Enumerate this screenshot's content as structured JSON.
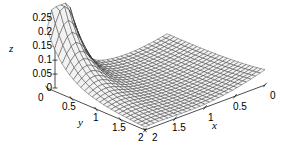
{
  "chart_data": {
    "type": "surface",
    "title": "",
    "xlabel": "x",
    "ylabel": "y",
    "zlabel": "z",
    "xlim": [
      0,
      2
    ],
    "ylim": [
      0,
      2
    ],
    "zlim": [
      0,
      0.28
    ],
    "grid": false,
    "legend": "none",
    "x_ticks": [
      "2",
      "1.5",
      "1",
      "0.5",
      "0"
    ],
    "x_tick_values": [
      2,
      1.5,
      1,
      0.5,
      0
    ],
    "y_ticks": [
      "0",
      "0.5",
      "1",
      "1.5",
      "2"
    ],
    "y_tick_values": [
      0,
      0.5,
      1,
      1.5,
      2
    ],
    "z_ticks": [
      "0",
      "0.05",
      "0.1",
      "0.15",
      "0.2",
      "0.25"
    ],
    "z_tick_values": [
      0,
      0.05,
      0.1,
      0.15,
      0.2,
      0.25
    ],
    "mesh": {
      "style": "wireframe-hidden-line",
      "line_color": "#1a1a1a",
      "fill_color": "#f2f2f2",
      "nx": 26,
      "ny": 26
    },
    "view": {
      "azimuth_deg": 315,
      "elevation_deg": 28,
      "x_axis_direction": "right-up",
      "y_axis_direction": "right-down"
    },
    "surface_description": "Sharp ridge near y=0 peaking at z~0.28 around x~0.25, decaying to a broad flat valley near z~0, rising again toward x=0 / large y edge",
    "peak_value": 0.28,
    "peak_at": {
      "x": 0.25,
      "y": 0.0
    }
  },
  "axes": {
    "z_name": "z",
    "y_name": "y",
    "x_name": "x"
  }
}
